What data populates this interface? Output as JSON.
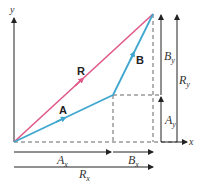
{
  "diagram": {
    "axes": {
      "x_label": "x",
      "y_label": "y"
    },
    "vectors": [
      {
        "name": "A",
        "label": "A",
        "color": "#3fa7cf",
        "from": [
          14,
          142
        ],
        "to": [
          113,
          95
        ]
      },
      {
        "name": "B",
        "label": "B",
        "color": "#3fa7cf",
        "from": [
          113,
          95
        ],
        "to": [
          153,
          14
        ]
      },
      {
        "name": "R",
        "label": "R",
        "color": "#e0588a",
        "from": [
          14,
          142
        ],
        "to": [
          153,
          14
        ]
      }
    ],
    "components": {
      "Ax": {
        "main": "A",
        "sub": "x"
      },
      "Bx": {
        "main": "B",
        "sub": "x"
      },
      "Rx": {
        "main": "R",
        "sub": "x"
      },
      "Ay": {
        "main": "A",
        "sub": "y"
      },
      "By": {
        "main": "B",
        "sub": "y"
      },
      "Ry": {
        "main": "R",
        "sub": "y"
      }
    },
    "colors": {
      "ab": "#3fa7cf",
      "r": "#e0588a",
      "axis": "#333333",
      "dashed": "#555555"
    }
  }
}
